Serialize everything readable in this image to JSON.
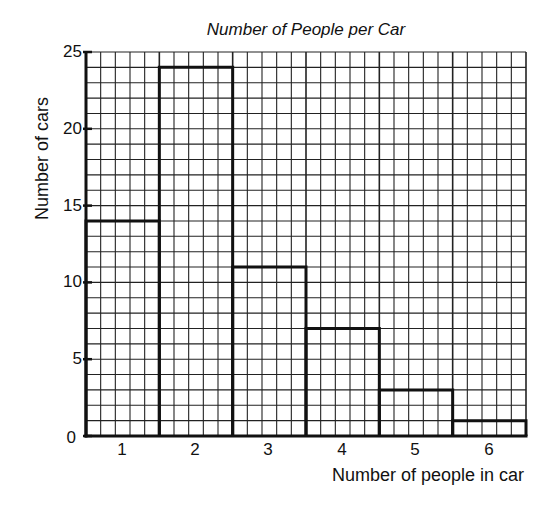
{
  "chart_data": {
    "type": "bar",
    "title": "Number of People per Car",
    "xlabel": "Number of people in car",
    "ylabel": "Number of cars",
    "categories": [
      "1",
      "2",
      "3",
      "4",
      "5",
      "6"
    ],
    "values": [
      14,
      24,
      11,
      7,
      3,
      1
    ],
    "ylim": [
      0,
      25
    ],
    "yticks": [
      "0",
      "5",
      "10",
      "15",
      "20",
      "25"
    ],
    "grid": true,
    "legend": null
  },
  "colors": {
    "line": "#111111",
    "grid": "#222222",
    "background": "#ffffff"
  }
}
